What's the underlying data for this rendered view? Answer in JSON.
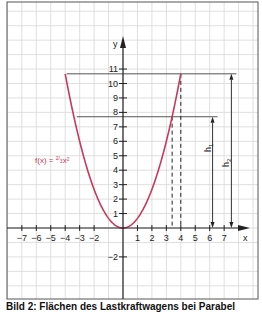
{
  "chart_data": {
    "type": "line",
    "title": "",
    "function_label": "f(x) = 2/3 x²",
    "function": {
      "a": 0.6667,
      "x_range": [
        -4,
        4
      ]
    },
    "xlabel": "x",
    "ylabel": "y",
    "xlim": [
      -8,
      9.3
    ],
    "ylim": [
      -4.9,
      15.6
    ],
    "x_ticks": [
      -7,
      -6,
      -5,
      -4,
      -3,
      -2,
      1,
      2,
      3,
      4,
      5,
      6,
      7
    ],
    "y_ticks": [
      -2,
      1,
      2,
      3,
      4,
      5,
      6,
      7,
      8,
      9,
      10,
      11
    ],
    "grid": true,
    "dashed_verticals": [
      3.4,
      4
    ],
    "heights": [
      {
        "name": "h1",
        "x": 6.2,
        "y": 7.7,
        "line_from_x": -3.2
      },
      {
        "name": "h2",
        "x": 7.5,
        "y": 10.67,
        "line_from_x": -3.9
      }
    ],
    "colors": {
      "curve": "#c8385a",
      "label": "#c8385a",
      "axis": "#222222",
      "grid": "#d8d8d8"
    }
  },
  "labels": {
    "fx_prefix": "f(x) = ",
    "fx_num": "2",
    "fx_den": "3",
    "fx_suffix": "x²",
    "x_axis": "x",
    "y_axis": "y",
    "h1": "h",
    "h1_sub": "1",
    "h2": "h",
    "h2_sub": "2"
  },
  "caption": "Bild 2: Flächen des Lastkraftwagens bei Parabel"
}
